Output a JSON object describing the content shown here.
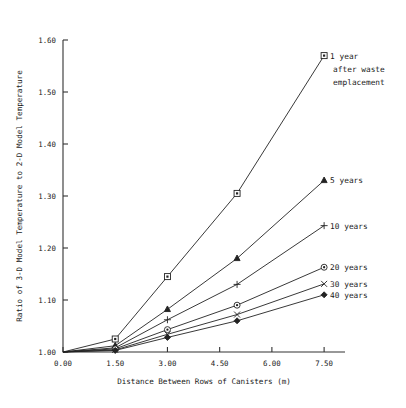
{
  "chart_data": {
    "type": "line",
    "title": "",
    "xlabel": "Distance Between Rows of Canisters (m)",
    "ylabel": "Ratio of 3-D Model Temperature to 2-D Model Temperature",
    "xlim": [
      0.0,
      8.1
    ],
    "ylim": [
      1.0,
      1.6
    ],
    "xticks": [
      0.0,
      1.5,
      3.0,
      4.5,
      6.0,
      7.5
    ],
    "xticklabels": [
      "0.00",
      "1.50",
      "3.00",
      "4.50",
      "6.00",
      "7.50"
    ],
    "yticks": [
      1.0,
      1.1,
      1.2,
      1.3,
      1.4,
      1.5,
      1.6
    ],
    "yticklabels": [
      "1.00",
      "1.10",
      "1.20",
      "1.30",
      "1.40",
      "1.50",
      "1.60"
    ],
    "grid": false,
    "legend_position": "right-inline",
    "x": [
      1.5,
      3.0,
      5.0,
      7.5
    ],
    "series": [
      {
        "name": "1 year after waste emplacement",
        "legend_label_lines": [
          "1 year",
          "after waste",
          "emplacement"
        ],
        "marker": "square",
        "values": [
          1.025,
          1.145,
          1.305,
          1.57
        ]
      },
      {
        "name": "5 years",
        "legend_label_lines": [
          "5 years"
        ],
        "marker": "triangle",
        "values": [
          1.012,
          1.082,
          1.18,
          1.33
        ]
      },
      {
        "name": "10 years",
        "legend_label_lines": [
          "10 years"
        ],
        "marker": "plus",
        "values": [
          1.008,
          1.062,
          1.13,
          1.243
        ]
      },
      {
        "name": "20 years",
        "legend_label_lines": [
          "20 years"
        ],
        "marker": "circle-dot",
        "values": [
          1.006,
          1.043,
          1.09,
          1.163
        ]
      },
      {
        "name": "30 years",
        "legend_label_lines": [
          "30 years"
        ],
        "marker": "cross",
        "values": [
          1.004,
          1.034,
          1.072,
          1.131
        ]
      },
      {
        "name": "40 years",
        "legend_label_lines": [
          "40 years"
        ],
        "marker": "diamond",
        "values": [
          1.003,
          1.028,
          1.06,
          1.11
        ]
      }
    ]
  }
}
